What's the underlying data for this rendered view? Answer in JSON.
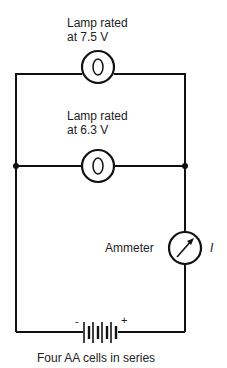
{
  "diagram": {
    "type": "circuit",
    "components": {
      "lamp1": {
        "label_line1": "Lamp rated",
        "label_line2": "at 7.5 V"
      },
      "lamp2": {
        "label_line1": "Lamp rated",
        "label_line2": "at 6.3 V"
      },
      "ammeter": {
        "label": "Ammeter",
        "current_symbol": "I"
      },
      "battery": {
        "label": "Four AA cells in series",
        "neg": "-",
        "pos": "+",
        "cells": 4
      }
    },
    "colors": {
      "line": "#111111",
      "text": "#222222",
      "background": "#ffffff"
    }
  }
}
